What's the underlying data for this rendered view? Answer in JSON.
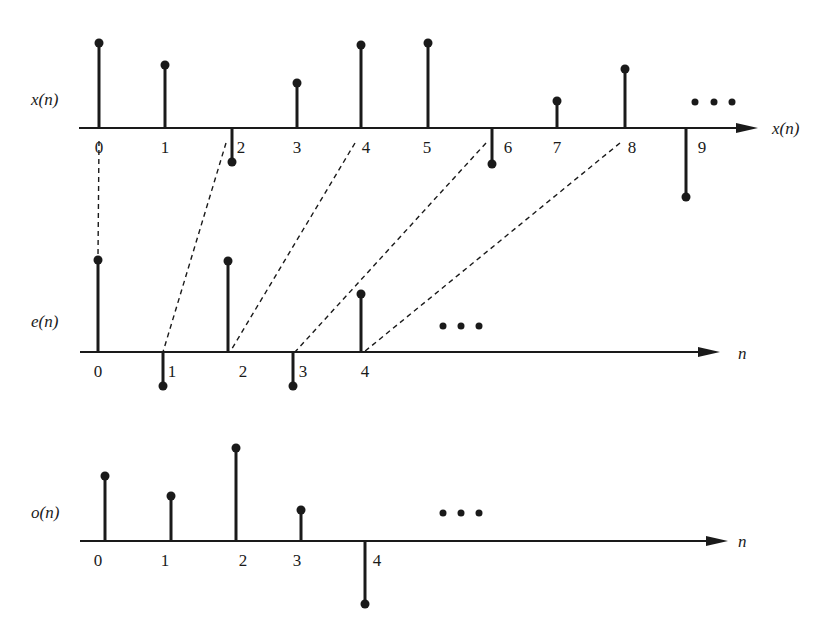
{
  "diagram": {
    "type": "stem-plot-decimation",
    "colors": {
      "ink": "#1a1a1a",
      "background": "#ffffff"
    }
  },
  "panels": [
    {
      "id": "x",
      "label": "x(n)",
      "axis_label": "x(n)",
      "ellipsis": "•••",
      "axis": {
        "y": 128,
        "x_start": 79,
        "x_end": 758
      },
      "ellipsis_pos": {
        "y": 102,
        "xs": [
          695,
          714,
          732
        ]
      },
      "samples": [
        {
          "n": "0",
          "x": 99,
          "tip": 43,
          "label_x": 99,
          "label_side": "center"
        },
        {
          "n": "1",
          "x": 165,
          "tip": 65,
          "label_x": 165,
          "label_side": "center"
        },
        {
          "n": "2",
          "x": 232,
          "tip": 162,
          "label_x": 241,
          "label_side": "right"
        },
        {
          "n": "3",
          "x": 297,
          "tip": 83,
          "label_x": 297,
          "label_side": "center"
        },
        {
          "n": "4",
          "x": 361,
          "tip": 45,
          "label_x": 366,
          "label_side": "center"
        },
        {
          "n": "5",
          "x": 428,
          "tip": 43,
          "label_x": 427,
          "label_side": "center"
        },
        {
          "n": "6",
          "x": 492,
          "tip": 164,
          "label_x": 508,
          "label_side": "right"
        },
        {
          "n": "7",
          "x": 557,
          "tip": 101,
          "label_x": 557,
          "label_side": "center"
        },
        {
          "n": "8",
          "x": 625,
          "tip": 69,
          "label_x": 632,
          "label_side": "center"
        },
        {
          "n": "9",
          "x": 686,
          "tip": 197,
          "label_x": 702,
          "label_side": "right"
        }
      ]
    },
    {
      "id": "e",
      "label": "e(n)",
      "axis_label": "n",
      "ellipsis": "•••",
      "axis": {
        "y": 352,
        "x_start": 80,
        "x_end": 720
      },
      "ellipsis_pos": {
        "y": 326,
        "xs": [
          443,
          461,
          479
        ]
      },
      "samples": [
        {
          "n": "0",
          "x": 98,
          "tip": 260,
          "label_x": 98,
          "label_side": "center"
        },
        {
          "n": "1",
          "x": 163,
          "tip": 386,
          "label_x": 172,
          "label_side": "right"
        },
        {
          "n": "2",
          "x": 228,
          "tip": 261,
          "label_x": 243,
          "label_side": "center"
        },
        {
          "n": "3",
          "x": 293,
          "tip": 386,
          "label_x": 303,
          "label_side": "right"
        },
        {
          "n": "4",
          "x": 361,
          "tip": 294,
          "label_x": 365,
          "label_side": "center"
        }
      ]
    },
    {
      "id": "o",
      "label": "o(n)",
      "axis_label": "n",
      "ellipsis": "•••",
      "axis": {
        "y": 541,
        "x_start": 80,
        "x_end": 728
      },
      "ellipsis_pos": {
        "y": 513,
        "xs": [
          443,
          461,
          479
        ]
      },
      "samples": [
        {
          "n": "0",
          "x": 105,
          "tip": 476,
          "label_x": 98,
          "label_side": "center"
        },
        {
          "n": "1",
          "x": 171,
          "tip": 496,
          "label_x": 165,
          "label_side": "center"
        },
        {
          "n": "2",
          "x": 236,
          "tip": 448,
          "label_x": 243,
          "label_side": "center"
        },
        {
          "n": "3",
          "x": 301,
          "tip": 510,
          "label_x": 297,
          "label_side": "center"
        },
        {
          "n": "4",
          "x": 365,
          "tip": 604,
          "label_x": 377,
          "label_side": "right"
        }
      ]
    }
  ],
  "connectors": [
    {
      "from": "x(0)",
      "to": "e(0)",
      "x1": 99,
      "y1": 141,
      "x2": 98,
      "y2": 256
    },
    {
      "from": "x(2)",
      "to": "e(1)",
      "x1": 226,
      "y1": 143,
      "x2": 163,
      "y2": 352
    },
    {
      "from": "x(4)",
      "to": "e(2)",
      "x1": 355,
      "y1": 143,
      "x2": 230,
      "y2": 352
    },
    {
      "from": "x(6)",
      "to": "e(3)",
      "x1": 486,
      "y1": 143,
      "x2": 295,
      "y2": 352
    },
    {
      "from": "x(8)",
      "to": "e(4)",
      "x1": 620,
      "y1": 143,
      "x2": 364,
      "y2": 352
    }
  ],
  "labels": {
    "x_signal": "x(n)",
    "e_signal": "e(n)",
    "o_signal": "o(n)",
    "x_axis_end": "x(n)",
    "e_axis_end": "n",
    "o_axis_end": "n"
  }
}
